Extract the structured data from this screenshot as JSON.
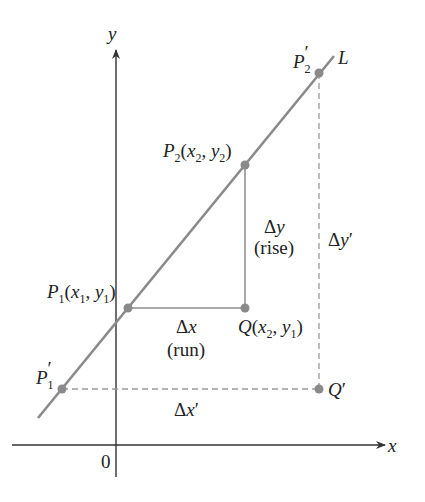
{
  "diagram": {
    "axes": {
      "x_label": "x",
      "y_label": "y",
      "origin_label": "0"
    },
    "line": {
      "label": "L",
      "color": "#8a8a8a"
    },
    "points": {
      "p1": {
        "name": "P",
        "sub": "1",
        "coords_open": "(",
        "x": "x",
        "x_sub": "1",
        "sep": ", ",
        "y": "y",
        "y_sub": "1",
        "coords_close": ")"
      },
      "p2": {
        "name": "P",
        "sub": "2",
        "coords_open": "(",
        "x": "x",
        "x_sub": "2",
        "sep": ", ",
        "y": "y",
        "y_sub": "2",
        "coords_close": ")"
      },
      "q": {
        "name": "Q",
        "coords_open": "(",
        "x": "x",
        "x_sub": "2",
        "sep": ", ",
        "y": "y",
        "y_sub": "1",
        "coords_close": ")"
      },
      "p1_prime": {
        "name": "P",
        "sub": "1",
        "prime": "′"
      },
      "p2_prime": {
        "name": "P",
        "sub": "2",
        "prime": "′"
      },
      "q_prime": {
        "name": "Q",
        "prime": "′"
      }
    },
    "annotations": {
      "delta": "Δ",
      "dy_var": "y",
      "dy_caption": "(rise)",
      "dx_var": "x",
      "dx_caption": "(run)",
      "dy_prime_var": "y",
      "dx_prime_var": "x",
      "prime": "′"
    },
    "colors": {
      "axis": "#333333",
      "line": "#8a8a8a",
      "dashed": "#9a9a9a",
      "text": "#222222"
    }
  }
}
